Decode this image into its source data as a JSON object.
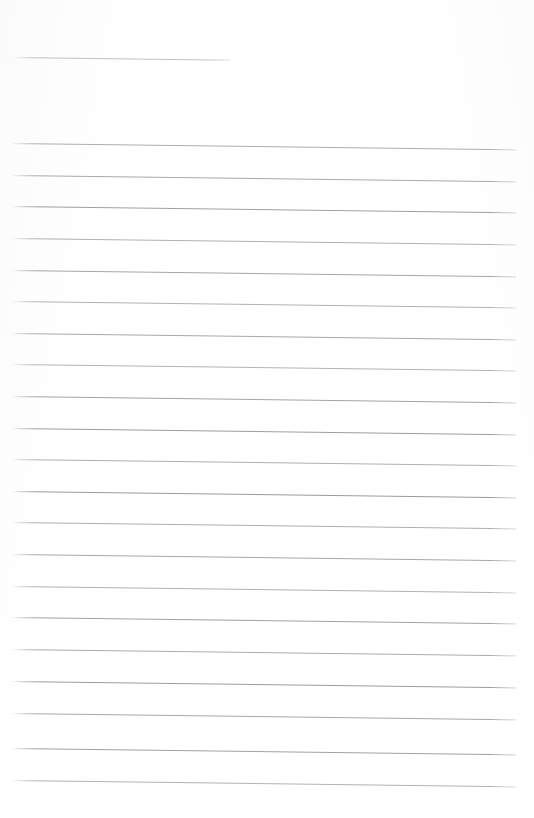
{
  "document": {
    "kind": "scanned-blank-ruled-page",
    "page_width": 534,
    "page_height": 818,
    "background_color": "#ffffff",
    "rule_color": "#a9a9ae",
    "rule_color_dark": "#8f9095",
    "rule_color_light": "#c2c2c6",
    "rule_thickness_px": 1,
    "visible_text": "",
    "note": "No text, headings, numbers, icons or controls are rendered on this page."
  },
  "title_rule": {
    "name": "title-underline-rule",
    "x": 13,
    "y": 57,
    "length": 218,
    "skew_deg": 0.75,
    "color": "#b3b3b7"
  },
  "body_rules": [
    {
      "index": 1,
      "x": 12,
      "y": 143,
      "length": 504,
      "skew_deg": 0.72,
      "color": "#adadb2"
    },
    {
      "index": 2,
      "x": 12,
      "y": 175,
      "length": 504,
      "skew_deg": 0.72,
      "color": "#a9a9ae"
    },
    {
      "index": 3,
      "x": 12,
      "y": 206,
      "length": 504,
      "skew_deg": 0.72,
      "color": "#9fa0a5"
    },
    {
      "index": 4,
      "x": 12,
      "y": 238,
      "length": 504,
      "skew_deg": 0.72,
      "color": "#b0b0b5"
    },
    {
      "index": 5,
      "x": 12,
      "y": 270,
      "length": 504,
      "skew_deg": 0.72,
      "color": "#a5a6ab"
    },
    {
      "index": 6,
      "x": 12,
      "y": 301,
      "length": 504,
      "skew_deg": 0.72,
      "color": "#b2b2b6"
    },
    {
      "index": 7,
      "x": 12,
      "y": 333,
      "length": 504,
      "skew_deg": 0.72,
      "color": "#a8a8ad"
    },
    {
      "index": 8,
      "x": 12,
      "y": 364,
      "length": 504,
      "skew_deg": 0.72,
      "color": "#b4b4b8"
    },
    {
      "index": 9,
      "x": 12,
      "y": 396,
      "length": 504,
      "skew_deg": 0.72,
      "color": "#a3a4a9"
    },
    {
      "index": 10,
      "x": 12,
      "y": 428,
      "length": 504,
      "skew_deg": 0.72,
      "color": "#9d9ea3"
    },
    {
      "index": 11,
      "x": 12,
      "y": 459,
      "length": 504,
      "skew_deg": 0.72,
      "color": "#afafb4"
    },
    {
      "index": 12,
      "x": 12,
      "y": 491,
      "length": 504,
      "skew_deg": 0.72,
      "color": "#9a9ba0"
    },
    {
      "index": 13,
      "x": 12,
      "y": 522,
      "length": 504,
      "skew_deg": 0.72,
      "color": "#aeaeb3"
    },
    {
      "index": 14,
      "x": 12,
      "y": 554,
      "length": 504,
      "skew_deg": 0.72,
      "color": "#a6a7ac"
    },
    {
      "index": 15,
      "x": 12,
      "y": 586,
      "length": 504,
      "skew_deg": 0.72,
      "color": "#b1b1b6"
    },
    {
      "index": 16,
      "x": 12,
      "y": 617,
      "length": 504,
      "skew_deg": 0.72,
      "color": "#a1a2a7"
    },
    {
      "index": 17,
      "x": 12,
      "y": 649,
      "length": 504,
      "skew_deg": 0.72,
      "color": "#aaaaaf"
    },
    {
      "index": 18,
      "x": 12,
      "y": 681,
      "length": 504,
      "skew_deg": 0.72,
      "color": "#9c9da2"
    },
    {
      "index": 19,
      "x": 12,
      "y": 713,
      "length": 504,
      "skew_deg": 0.72,
      "color": "#a7a8ad"
    },
    {
      "index": 20,
      "x": 12,
      "y": 748,
      "length": 504,
      "skew_deg": 0.72,
      "color": "#a0a1a6"
    },
    {
      "index": 21,
      "x": 12,
      "y": 780,
      "length": 504,
      "skew_deg": 0.72,
      "color": "#b3b3b8"
    }
  ]
}
